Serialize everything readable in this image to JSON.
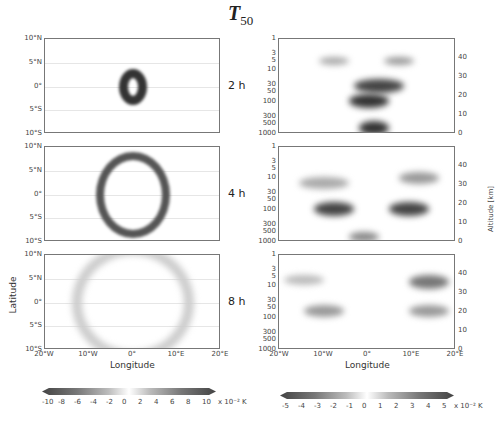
{
  "figure": {
    "title_main": "T",
    "title_sub": "50"
  },
  "rows": [
    {
      "label": "2 h"
    },
    {
      "label": "4 h"
    },
    {
      "label": "8 h"
    }
  ],
  "left_axis": {
    "lat_ticks": [
      "10°N",
      "5°N",
      "0°",
      "5°S",
      "10°S"
    ],
    "lon_ticks": [
      "20°W",
      "10°W",
      "0°",
      "10°E",
      "20°E"
    ],
    "ylabel": "Latitude",
    "xlabel": "Longitude"
  },
  "right_axis": {
    "pressure_ticks": [
      "1",
      "3",
      "5",
      "10",
      "30",
      "50",
      "100",
      "300",
      "500",
      "1000"
    ],
    "altitude_ticks": [
      "40",
      "30",
      "20",
      "10",
      "0"
    ],
    "altitude_label": "Altitude [km]",
    "lon_ticks": [
      "20°W",
      "10°W",
      "0°",
      "10°E",
      "20°E"
    ],
    "xlabel": "Longitude"
  },
  "colorbars": {
    "left": {
      "ticks": [
        "-10",
        "-8",
        "-6",
        "-4",
        "-2",
        "0",
        "2",
        "4",
        "6",
        "8",
        "10"
      ],
      "unit": "x 10⁻² K"
    },
    "right": {
      "ticks": [
        "-5",
        "-4",
        "-3",
        "-2",
        "-1",
        "0",
        "1",
        "2",
        "3",
        "4",
        "5"
      ],
      "unit": "x 10⁻² K"
    }
  },
  "chart_data": [
    {
      "type": "heatmap",
      "title": "T50 horizontal section (latitude-longitude), grayscale anomaly",
      "panels": [
        "2 h",
        "4 h",
        "8 h"
      ],
      "xlabel": "Longitude",
      "ylabel": "Latitude",
      "xlim": [
        "20°W",
        "20°E"
      ],
      "ylim": [
        "10°S",
        "10°N"
      ],
      "colorbar": {
        "range": [
          -10,
          10
        ],
        "unit": "x 10^-2 K",
        "ticks": [
          -10,
          -8,
          -6,
          -4,
          -2,
          0,
          2,
          4,
          6,
          8,
          10
        ]
      },
      "description": {
        "2 h": "compact ring centered at 0°,0° radius ~2-3°, strong dark amplitude",
        "4 h": "expanded ring radius ~5°, dark outer ring with bright inner ring",
        "8 h": "faint wide ring radius ~10°, light amplitudes"
      }
    },
    {
      "type": "heatmap",
      "title": "T50 vertical section (pressure-longitude), grayscale anomaly",
      "panels": [
        "2 h",
        "4 h",
        "8 h"
      ],
      "xlabel": "Longitude",
      "ylabel": "Pressure (hPa)",
      "y2label": "Altitude [km]",
      "xlim": [
        "20°W",
        "20°E"
      ],
      "ylim": [
        1000,
        1
      ],
      "y2lim": [
        0,
        48
      ],
      "colorbar": {
        "range": [
          -5,
          5
        ],
        "unit": "x 10^-2 K",
        "ticks": [
          -5,
          -4,
          -3,
          -2,
          -1,
          0,
          1,
          2,
          3,
          4,
          5
        ]
      },
      "description": {
        "2 h": "V-shaped wave fronts near 0°, strong blob at 300-1000 hPa",
        "4 h": "wider V-shaped bands spreading to ±12°",
        "8 h": "bands displaced to ±10-20° at 3-100 hPa"
      }
    }
  ]
}
